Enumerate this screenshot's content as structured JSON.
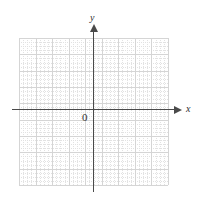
{
  "figure": {
    "kind": "cartesian-coordinate-plane",
    "background_color": "#ffffff",
    "width": 202,
    "height": 205
  },
  "labels": {
    "x_axis": "x",
    "y_axis": "y",
    "origin": "0"
  },
  "chart_data": {
    "type": "scatter",
    "title": "",
    "subtitle": "",
    "xlabel": "x",
    "ylabel": "y",
    "origin_label": "0",
    "series": [],
    "x": [],
    "values": [],
    "xlim": [
      -4.5,
      4.5
    ],
    "ylim": [
      -4.5,
      4.5
    ],
    "x_ticklabels": [],
    "y_ticklabels": [],
    "grid": true,
    "grid_major_cells_x": 9,
    "grid_major_cells_y": 9,
    "grid_minor_per_major": 4,
    "grid_major_color": "#d5d5d5",
    "grid_minor_color": "#e2e2e2",
    "axis_color": "#4a4a4a",
    "legend": [],
    "legend_position": "none",
    "annotations": [],
    "axis_arrows": [
      "x-positive",
      "y-positive"
    ],
    "origin_pixel": [
      93,
      110
    ]
  }
}
